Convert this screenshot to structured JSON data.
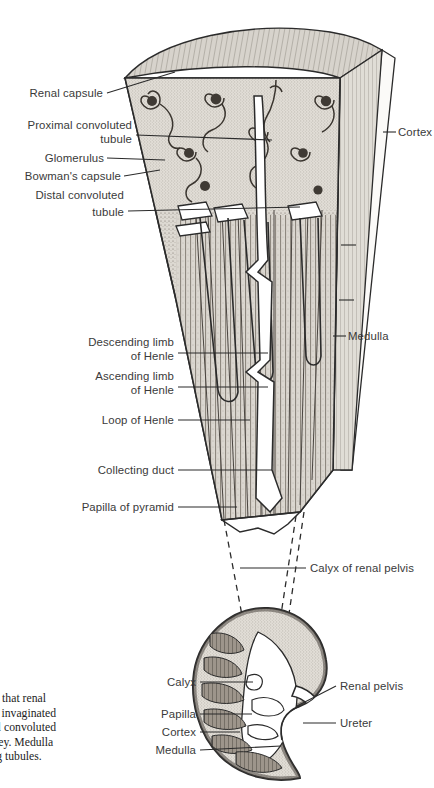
{
  "figure": {
    "colors": {
      "ink": "#2b2b2b",
      "label_text": "#3a3a3a",
      "caption_text": "#1d1d1d",
      "background": "#ffffff",
      "tissue_fill": "#cfcbc4",
      "tissue_light": "#e6e3dd",
      "dark_structure": "#4a4540"
    }
  },
  "wedge_labels": {
    "left": [
      {
        "id": "renal-capsule",
        "lines": [
          "Renal capsule"
        ],
        "x": 103,
        "y": 97,
        "leader_to_x": 175,
        "leader_to_y": 72
      },
      {
        "id": "proximal-convoluted-tubule",
        "lines": [
          "Proximal convoluted",
          "tubule"
        ],
        "x": 132,
        "y": 129,
        "leader_to_x": 272,
        "leader_to_y": 140
      },
      {
        "id": "glomerulus",
        "lines": [
          "Glomerulus"
        ],
        "x": 104,
        "y": 162,
        "leader_to_x": 165,
        "leader_to_y": 160
      },
      {
        "id": "bowmans-capsule",
        "lines": [
          "Bowman's capsule"
        ],
        "x": 121,
        "y": 180,
        "leader_to_x": 160,
        "leader_to_y": 172
      },
      {
        "id": "distal-convoluted-tubule",
        "lines": [
          "Distal convoluted",
          "tubule"
        ],
        "x": 124,
        "y": 199,
        "leader_to_x": 300,
        "leader_to_y": 207
      },
      {
        "id": "descending-limb-of-henle",
        "lines": [
          "Descending limb",
          "of Henle"
        ],
        "x": 174,
        "y": 342,
        "leader_to_x": 268,
        "leader_to_y": 353
      },
      {
        "id": "ascending-limb-of-henle",
        "lines": [
          "Ascending limb",
          "of Henle"
        ],
        "x": 174,
        "y": 376,
        "leader_to_x": 268,
        "leader_to_y": 386
      },
      {
        "id": "loop-of-henle",
        "lines": [
          "Loop of Henle"
        ],
        "x": 174,
        "y": 424,
        "leader_to_x": 250,
        "leader_to_y": 424
      },
      {
        "id": "collecting-duct",
        "lines": [
          "Collecting duct"
        ],
        "x": 174,
        "y": 473,
        "leader_to_x": 272,
        "leader_to_y": 473
      },
      {
        "id": "papilla-of-pyramid",
        "lines": [
          "Papilla of pyramid"
        ],
        "x": 174,
        "y": 510,
        "leader_to_x": 237,
        "leader_to_y": 510
      }
    ],
    "right": [
      {
        "id": "cortex",
        "lines": [
          "Cortex"
        ],
        "x": 398,
        "y": 136,
        "leader_to_x": 383,
        "leader_to_y": 136
      },
      {
        "id": "medulla",
        "lines": [
          "Medulla"
        ],
        "x": 344,
        "y": 340,
        "leader_to_x": 333,
        "leader_to_y": 340
      }
    ]
  },
  "kidney_labels": {
    "left": [
      {
        "id": "calyx",
        "lines": [
          "Calyx"
        ],
        "x": 196,
        "y": 686,
        "leader_to_x": 253,
        "leader_to_y": 682
      },
      {
        "id": "papilla",
        "lines": [
          "Papilla"
        ],
        "x": 196,
        "y": 718,
        "leader_to_x": 252,
        "leader_to_y": 716
      },
      {
        "id": "cortex-kidney",
        "lines": [
          "Cortex"
        ],
        "x": 196,
        "y": 736,
        "leader_to_x": 240,
        "leader_to_y": 735
      },
      {
        "id": "medulla-kidney",
        "lines": [
          "Medulla"
        ],
        "x": 196,
        "y": 754,
        "leader_to_x": 281,
        "leader_to_y": 748
      }
    ],
    "right": [
      {
        "id": "calyx-of-renal-pelvis",
        "lines": [
          "Calyx of renal pelvis"
        ],
        "x": 308,
        "y": 572,
        "leader_to_x": 240,
        "leader_to_y": 568
      },
      {
        "id": "renal-pelvis",
        "lines": [
          "Renal pelvis"
        ],
        "x": 338,
        "y": 689,
        "leader_to_x": 297,
        "leader_to_y": 706
      },
      {
        "id": "ureter",
        "lines": [
          "Ureter"
        ],
        "x": 338,
        "y": 727,
        "leader_to_x": 303,
        "leader_to_y": 726
      }
    ]
  },
  "caption": {
    "lines": [
      "ge shows that renal",
      "ules with invaginated",
      "and distal convoluted",
      "x of kidney. Medulla",
      "collecting tubules."
    ]
  }
}
